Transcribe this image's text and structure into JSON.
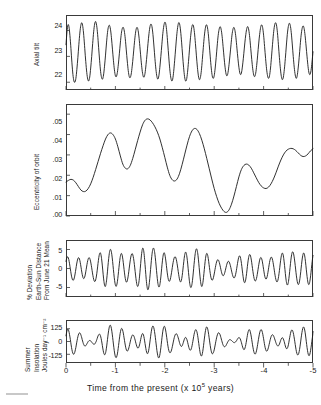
{
  "figure": {
    "xlabel_pre": "Time from the present (x 10",
    "xlabel_exp": "5",
    "xlabel_post": " years)",
    "x_ticks": [
      "0",
      "-1",
      "-2",
      "-3",
      "-4",
      "-5"
    ],
    "x_range": [
      0,
      -5
    ],
    "curve_color": "#1a1a1a",
    "frame_color": "#3a3a3a"
  },
  "panels": [
    {
      "name": "axial-tilt",
      "ylabel_lines": [
        "Axial tilt"
      ],
      "y_ticks": [
        "24",
        "23",
        "22"
      ],
      "y_tick_values": [
        24,
        23,
        22
      ]
    },
    {
      "name": "eccentricity",
      "ylabel_lines": [
        "Eccentricity of orbit"
      ],
      "y_ticks": [
        ".05",
        ".04",
        ".03",
        ".02",
        ".01",
        ".00"
      ],
      "y_tick_values": [
        0.05,
        0.04,
        0.03,
        0.02,
        0.01,
        0.0
      ]
    },
    {
      "name": "earth-sun-distance",
      "ylabel_lines": [
        "% Deviation",
        "Earth-Sun Distance",
        "From June 21 Mean"
      ],
      "y_ticks": [
        "5",
        "0",
        "-5"
      ],
      "y_tick_values": [
        5,
        0,
        -5
      ]
    },
    {
      "name": "summer-insolation",
      "ylabel_lines": [
        "Summer",
        "Insolation",
        "Joules day⁻¹ cm⁻²"
      ],
      "y_ticks": [
        "125",
        "0",
        "-125"
      ],
      "y_tick_values": [
        125,
        0,
        -125
      ]
    }
  ],
  "chart_data": [
    {
      "type": "line",
      "title": "Axial tilt",
      "xlabel": "Time from the present (x 10^5 years)",
      "ylabel": "Axial tilt",
      "xlim": [
        0,
        -5
      ],
      "ylim": [
        21.7,
        24.6
      ],
      "yticks": [
        24,
        23,
        22
      ],
      "xticks": [
        0,
        -1,
        -2,
        -3,
        -4,
        -5
      ],
      "grid": false,
      "units": "degrees",
      "period_kyr": 41,
      "x": [
        0.0,
        0.02,
        0.04,
        0.06,
        0.08,
        0.1,
        0.12,
        0.14,
        0.16,
        0.18,
        0.2,
        0.22,
        0.24,
        0.26,
        0.28,
        0.3,
        0.32,
        0.34,
        0.36,
        0.38,
        0.4,
        0.42,
        0.44,
        0.46,
        0.48,
        0.5,
        0.52,
        0.54,
        0.56,
        0.58,
        0.6,
        0.62,
        0.64,
        0.66,
        0.68,
        0.7,
        0.72,
        0.74,
        0.76,
        0.78,
        0.8,
        0.82,
        0.84,
        0.86,
        0.88,
        0.9,
        0.92,
        0.94,
        0.96,
        0.98,
        1.0,
        1.02,
        1.04,
        1.06,
        1.08,
        1.1,
        1.12,
        1.14,
        1.16,
        1.18,
        1.2,
        1.22,
        1.24,
        1.26,
        1.28,
        1.3,
        1.32,
        1.34,
        1.36,
        1.38,
        1.4,
        1.42,
        1.44,
        1.46,
        1.48,
        1.5,
        1.52,
        1.54,
        1.56,
        1.58,
        1.6,
        1.62,
        1.64,
        1.66,
        1.68,
        1.7,
        1.72,
        1.74,
        1.76,
        1.78,
        1.8,
        1.82,
        1.84,
        1.86,
        1.88,
        1.9,
        1.92,
        1.94,
        1.96,
        1.98,
        2.0,
        2.02,
        2.04,
        2.06,
        2.08,
        2.1,
        2.12,
        2.14,
        2.16,
        2.18,
        2.2,
        2.22,
        2.24,
        2.26,
        2.28,
        2.3,
        2.32,
        2.34,
        2.36,
        2.38,
        2.4,
        2.42,
        2.44,
        2.46,
        2.48,
        2.5,
        2.52,
        2.54,
        2.56,
        2.58,
        2.6,
        2.62,
        2.64,
        2.66,
        2.68,
        2.7,
        2.72,
        2.74,
        2.76,
        2.78,
        2.8,
        2.82,
        2.84,
        2.86,
        2.88,
        2.9,
        2.92,
        2.94,
        2.96,
        2.98,
        3.0,
        3.02,
        3.04,
        3.06,
        3.08,
        3.1,
        3.12,
        3.14,
        3.16,
        3.18,
        3.2,
        3.22,
        3.24,
        3.26,
        3.28,
        3.3,
        3.32,
        3.34,
        3.36,
        3.38,
        3.4,
        3.42,
        3.44,
        3.46,
        3.48,
        3.5,
        3.52,
        3.54,
        3.56,
        3.58,
        3.6,
        3.62,
        3.64,
        3.66,
        3.68,
        3.7,
        3.72,
        3.74,
        3.76,
        3.78,
        3.8,
        3.82,
        3.84,
        3.86,
        3.88,
        3.9,
        3.92,
        3.94,
        3.96,
        3.98,
        4.0,
        4.02,
        4.04,
        4.06,
        4.08,
        4.1,
        4.12,
        4.14,
        4.16,
        4.18,
        4.2,
        4.22,
        4.24,
        4.26,
        4.28,
        4.3,
        4.32,
        4.34,
        4.36,
        4.38,
        4.4,
        4.42,
        4.44,
        4.46,
        4.48,
        4.5,
        4.52,
        4.54,
        4.56,
        4.58,
        4.6,
        4.62,
        4.64,
        4.66,
        4.68,
        4.7,
        4.72,
        4.74,
        4.76,
        4.78,
        4.8,
        4.82,
        4.84,
        4.86,
        4.88,
        4.9,
        4.92,
        4.94,
        4.96,
        4.98,
        5.0
      ],
      "y": [
        23.45,
        23.95,
        24.22,
        24.15,
        23.8,
        23.3,
        22.75,
        22.3,
        22.05,
        22.0,
        22.15,
        22.5,
        22.95,
        23.45,
        23.9,
        24.2,
        24.3,
        24.15,
        23.8,
        23.3,
        22.8,
        22.38,
        22.12,
        22.05,
        22.2,
        22.55,
        23.0,
        23.5,
        23.95,
        24.25,
        24.35,
        24.2,
        23.85,
        23.35,
        22.85,
        22.42,
        22.18,
        22.12,
        22.28,
        22.62,
        23.05,
        23.52,
        23.92,
        24.15,
        24.2,
        24.05,
        23.72,
        23.28,
        22.85,
        22.48,
        22.25,
        22.22,
        22.38,
        22.7,
        23.1,
        23.52,
        23.88,
        24.08,
        24.12,
        23.98,
        23.68,
        23.25,
        22.82,
        22.45,
        22.22,
        22.18,
        22.32,
        22.62,
        23.0,
        23.42,
        23.8,
        24.05,
        24.12,
        24.0,
        23.7,
        23.28,
        22.85,
        22.48,
        22.25,
        22.2,
        22.35,
        22.68,
        23.08,
        23.5,
        23.88,
        24.15,
        24.25,
        24.15,
        23.85,
        23.4,
        22.92,
        22.5,
        22.22,
        22.12,
        22.25,
        22.58,
        23.0,
        23.45,
        23.88,
        24.18,
        24.32,
        24.25,
        23.95,
        23.48,
        22.98,
        22.52,
        22.2,
        22.05,
        22.12,
        22.42,
        22.85,
        23.32,
        23.78,
        24.12,
        24.3,
        24.25,
        23.98,
        23.55,
        23.05,
        22.58,
        22.22,
        22.05,
        22.1,
        22.38,
        22.8,
        23.28,
        23.72,
        24.05,
        24.22,
        24.18,
        23.92,
        23.5,
        23.02,
        22.58,
        22.25,
        22.1,
        22.18,
        22.45,
        22.88,
        23.35,
        23.78,
        24.08,
        24.22,
        24.15,
        23.88,
        23.45,
        22.98,
        22.55,
        22.25,
        22.15,
        22.25,
        22.55,
        22.95,
        23.4,
        23.8,
        24.05,
        24.15,
        24.05,
        23.78,
        23.38,
        22.95,
        22.58,
        22.32,
        22.25,
        22.38,
        22.68,
        23.05,
        23.45,
        23.82,
        24.05,
        24.12,
        24.0,
        23.72,
        23.32,
        22.92,
        22.58,
        22.35,
        22.3,
        22.45,
        22.75,
        23.12,
        23.52,
        23.85,
        24.08,
        24.15,
        24.02,
        23.72,
        23.3,
        22.88,
        22.52,
        22.28,
        22.22,
        22.35,
        22.65,
        23.05,
        23.48,
        23.85,
        24.12,
        24.22,
        24.12,
        23.82,
        23.38,
        22.92,
        22.52,
        22.25,
        22.15,
        22.25,
        22.55,
        22.98,
        23.45,
        23.88,
        24.18,
        24.3,
        24.22,
        23.92,
        23.45,
        22.95,
        22.52,
        22.22,
        22.1,
        22.2,
        22.5,
        22.92,
        23.4,
        23.85,
        24.15,
        24.28,
        24.2,
        23.92,
        23.48,
        23.0,
        22.58,
        22.28,
        22.15,
        22.25,
        22.55,
        22.95,
        23.42,
        23.82,
        24.08,
        24.18,
        24.08,
        23.8,
        23.4,
        22.98,
        22.6,
        22.35,
        22.3,
        22.45,
        22.78,
        23.18,
        23.58
      ]
    },
    {
      "type": "line",
      "title": "Eccentricity of orbit",
      "xlabel": "Time from the present (x 10^5 years)",
      "ylabel": "Eccentricity of orbit",
      "xlim": [
        0,
        -5
      ],
      "ylim": [
        0.0,
        0.055
      ],
      "yticks": [
        0.05,
        0.04,
        0.03,
        0.02,
        0.01,
        0.0
      ],
      "xticks": [
        0,
        -1,
        -2,
        -3,
        -4,
        -5
      ],
      "grid": false,
      "period_kyr": 100,
      "x": [
        0.0,
        0.05,
        0.1,
        0.15,
        0.2,
        0.25,
        0.3,
        0.35,
        0.4,
        0.45,
        0.5,
        0.55,
        0.6,
        0.65,
        0.7,
        0.75,
        0.8,
        0.85,
        0.9,
        0.95,
        1.0,
        1.05,
        1.1,
        1.15,
        1.2,
        1.25,
        1.3,
        1.35,
        1.4,
        1.45,
        1.5,
        1.55,
        1.6,
        1.65,
        1.7,
        1.75,
        1.8,
        1.85,
        1.9,
        1.95,
        2.0,
        2.05,
        2.1,
        2.15,
        2.2,
        2.25,
        2.3,
        2.35,
        2.4,
        2.45,
        2.5,
        2.55,
        2.6,
        2.65,
        2.7,
        2.75,
        2.8,
        2.85,
        2.9,
        2.95,
        3.0,
        3.05,
        3.1,
        3.15,
        3.2,
        3.25,
        3.3,
        3.35,
        3.4,
        3.45,
        3.5,
        3.55,
        3.6,
        3.65,
        3.7,
        3.75,
        3.8,
        3.85,
        3.9,
        3.95,
        4.0,
        4.05,
        4.1,
        4.15,
        4.2,
        4.25,
        4.3,
        4.35,
        4.4,
        4.45,
        4.5,
        4.55,
        4.6,
        4.65,
        4.7,
        4.75,
        4.8,
        4.85,
        4.9,
        4.95,
        5.0
      ],
      "y": [
        0.0167,
        0.0175,
        0.018,
        0.0176,
        0.0163,
        0.0145,
        0.0128,
        0.012,
        0.0122,
        0.0135,
        0.0158,
        0.019,
        0.0228,
        0.0268,
        0.0308,
        0.0345,
        0.0378,
        0.04,
        0.0408,
        0.04,
        0.0378,
        0.034,
        0.0295,
        0.0255,
        0.0235,
        0.0232,
        0.0248,
        0.0282,
        0.0325,
        0.037,
        0.0412,
        0.0448,
        0.047,
        0.0477,
        0.0472,
        0.0458,
        0.0438,
        0.0412,
        0.0378,
        0.0335,
        0.0288,
        0.024,
        0.02,
        0.0178,
        0.0172,
        0.0182,
        0.021,
        0.0252,
        0.03,
        0.0348,
        0.039,
        0.0418,
        0.043,
        0.0425,
        0.0405,
        0.0372,
        0.033,
        0.0282,
        0.0232,
        0.0182,
        0.0135,
        0.0095,
        0.0062,
        0.0038,
        0.0022,
        0.0018,
        0.003,
        0.0058,
        0.0098,
        0.0145,
        0.0192,
        0.0228,
        0.0248,
        0.0255,
        0.025,
        0.0235,
        0.0212,
        0.0188,
        0.0165,
        0.0148,
        0.0138,
        0.0135,
        0.0142,
        0.0158,
        0.0182,
        0.0212,
        0.0245,
        0.0275,
        0.03,
        0.0318,
        0.0328,
        0.0332,
        0.033,
        0.0322,
        0.031,
        0.0298,
        0.0292,
        0.0295,
        0.0305,
        0.032,
        0.033
      ]
    },
    {
      "type": "line",
      "title": "% Deviation Earth-Sun Distance From June 21 Mean",
      "xlabel": "Time from the present (x 10^5 years)",
      "ylabel": "% Deviation Earth-Sun Distance From June 21 Mean",
      "xlim": [
        0,
        -5
      ],
      "ylim": [
        -7.5,
        7.5
      ],
      "yticks": [
        5,
        0,
        -5
      ],
      "xticks": [
        0,
        -1,
        -2,
        -3,
        -4,
        -5
      ],
      "grid": false,
      "units": "percent",
      "period_kyr": 21.7,
      "description": "Precession index: sin-like carrier of ~21.7 kyr period amplitude-modulated by the eccentricity curve in panel 2."
    },
    {
      "type": "line",
      "title": "Summer Insolation",
      "xlabel": "Time from the present (x 10^5 years)",
      "ylabel": "Summer Insolation Joules day^-1 cm^-2",
      "xlim": [
        0,
        -5
      ],
      "ylim": [
        -210,
        210
      ],
      "yticks": [
        125,
        0,
        -125
      ],
      "xticks": [
        0,
        -1,
        -2,
        -3,
        -4,
        -5
      ],
      "grid": false,
      "units": "Joules day^-1 cm^-2",
      "description": "Caloric summer half-year insolation at 65N: combination of the 41 kyr obliquity signal and the eccentricity-modulated 21.7 kyr precession signal."
    }
  ]
}
